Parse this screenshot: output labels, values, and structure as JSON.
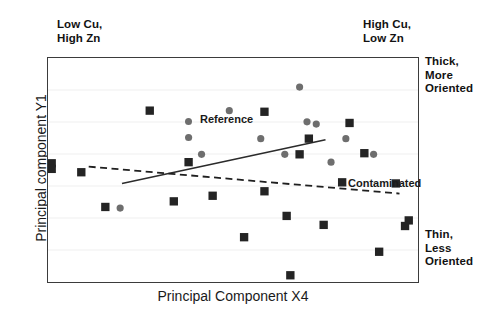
{
  "annotations": {
    "top_left": "Low Cu,\nHigh Zn",
    "top_right": "High Cu,\nLow Zn",
    "right_top": "Thick,\nMore\nOriented",
    "right_bottom": "Thin,\nLess\nOriented"
  },
  "chart_data": {
    "type": "scatter",
    "title": "",
    "xlabel": "Principal Component X4",
    "ylabel": "Principal component Y1",
    "xlim": [
      0,
      100
    ],
    "ylim": [
      0,
      100
    ],
    "grid": "horizontal",
    "legend_position": "in-plot",
    "series": [
      {
        "name": "Reference",
        "marker": "circle",
        "color": "#6e6e6e",
        "points": [
          [
            49.0,
            76.5
          ],
          [
            38.0,
            64.5
          ],
          [
            41.5,
            57.0
          ],
          [
            57.5,
            64.0
          ],
          [
            64.0,
            57.0
          ],
          [
            68.0,
            87.0
          ],
          [
            72.5,
            70.5
          ],
          [
            76.5,
            53.5
          ],
          [
            80.5,
            64.0
          ],
          [
            88.0,
            57.0
          ],
          [
            19.5,
            33.0
          ],
          [
            70.0,
            71.5
          ]
        ]
      },
      {
        "name": "Contaminated",
        "marker": "square",
        "color": "#242424",
        "points": [
          [
            27.5,
            76.5
          ],
          [
            1.0,
            53.0
          ],
          [
            1.0,
            50.5
          ],
          [
            38.0,
            53.5
          ],
          [
            58.5,
            76.0
          ],
          [
            70.5,
            64.0
          ],
          [
            68.0,
            57.0
          ],
          [
            81.5,
            71.0
          ],
          [
            85.5,
            57.5
          ],
          [
            79.5,
            44.5
          ],
          [
            34.0,
            36.0
          ],
          [
            44.5,
            38.5
          ],
          [
            58.5,
            40.5
          ],
          [
            64.5,
            29.5
          ],
          [
            94.0,
            44.0
          ],
          [
            74.5,
            25.5
          ],
          [
            97.5,
            27.5
          ],
          [
            96.5,
            25.0
          ],
          [
            89.5,
            13.5
          ],
          [
            53.0,
            20.0
          ],
          [
            65.5,
            3.0
          ],
          [
            15.5,
            33.5
          ],
          [
            9.0,
            49.0
          ]
        ]
      }
    ],
    "trendlines": [
      {
        "name": "Reference",
        "style": "solid",
        "color": "#2b2b2b",
        "x0": 20.0,
        "y0": 44.0,
        "x1": 75.0,
        "y1": 63.5
      },
      {
        "name": "Contaminated",
        "style": "dash-dot",
        "color": "#1f1f1f",
        "x0": 11.0,
        "y0": 51.5,
        "x1": 95.0,
        "y1": 39.5
      }
    ],
    "inplot_labels": [
      {
        "name": "Reference",
        "text": "Reference"
      },
      {
        "name": "Contaminated",
        "text": "Contaminated"
      }
    ]
  }
}
